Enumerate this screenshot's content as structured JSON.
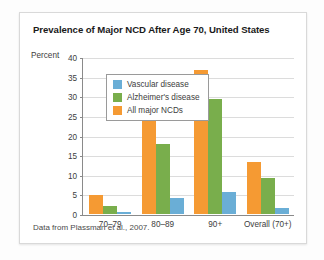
{
  "figure": {
    "title": "Prevalence of Major NCD After Age 70, United States",
    "source_note": "Data from Plassman et al., 2007."
  },
  "chart_data": {
    "type": "bar",
    "title": "Prevalence of Major NCD After Age 70, United States",
    "xlabel": "",
    "ylabel": "Percent",
    "ylim": [
      0,
      40
    ],
    "yticks": [
      0,
      5,
      10,
      15,
      20,
      25,
      30,
      35,
      40
    ],
    "grid": true,
    "legend_position": "upper-left-inside",
    "categories": [
      "70–79",
      "80–89",
      "90+",
      "Overall (70+)"
    ],
    "series": [
      {
        "name": "All major NCDs",
        "color": "#f59a33",
        "values": [
          5,
          24,
          37,
          13.3
        ]
      },
      {
        "name": "Alzheimer's disease",
        "color": "#79ae4c",
        "values": [
          2,
          18,
          29.5,
          9.3
        ]
      },
      {
        "name": "Vascular disease",
        "color": "#6aaed6",
        "values": [
          0.6,
          4,
          5.6,
          1.5
        ]
      }
    ],
    "legend_order": [
      "Vascular disease",
      "Alzheimer's disease",
      "All major NCDs"
    ],
    "annotations": [
      "Data from Plassman et al., 2007."
    ]
  }
}
